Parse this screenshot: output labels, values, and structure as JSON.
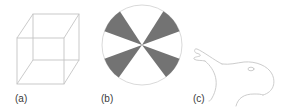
{
  "panels": [
    {
      "id": "a",
      "label": "(a)",
      "subject": "necker-cube"
    },
    {
      "id": "b",
      "label": "(b)",
      "subject": "figure-ground-disc",
      "sectors": 12,
      "fill_color": "#737373"
    },
    {
      "id": "c",
      "label": "(c)",
      "subject": "duck-rabbit"
    }
  ],
  "colors": {
    "line": "#bdbdbd",
    "circle_outline": "#c8c8c8",
    "sector_fill": "#737373",
    "label_text": "#3a3a3a"
  }
}
